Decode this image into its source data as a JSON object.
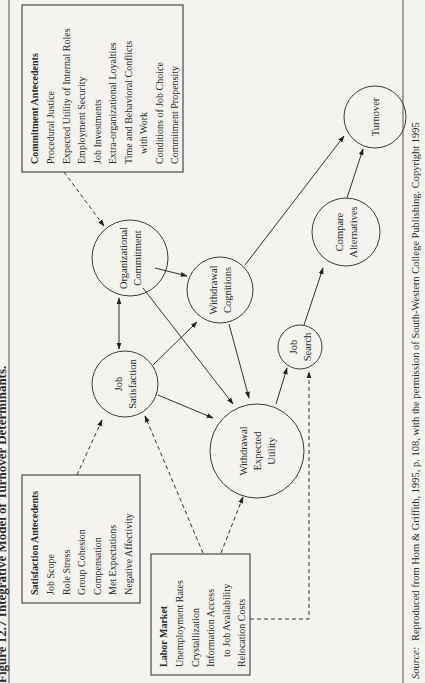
{
  "figure": {
    "title": "Figure 12.7 Integrative Model of Turnover Determinants.",
    "orientation": "rotated-90-ccw"
  },
  "nodes": {
    "organizational_commitment": {
      "lines": [
        "Organizational",
        "Commitment"
      ]
    },
    "job_satisfaction": {
      "lines": [
        "Job",
        "Satisfaction"
      ]
    },
    "withdrawal_cognitions": {
      "lines": [
        "Withdrawal",
        "Cognitions"
      ]
    },
    "withdrawal_expected_utility": {
      "lines": [
        "Withdrawal",
        "Expected",
        "Utility"
      ]
    },
    "job_search": {
      "lines": [
        "Job",
        "Search"
      ]
    },
    "compare_alternatives": {
      "lines": [
        "Compare",
        "Alternatives"
      ]
    },
    "turnover": {
      "lines": [
        "Turnover"
      ]
    }
  },
  "boxes": {
    "commitment_antecedents": {
      "heading": "Commitment Antecedents",
      "items": [
        "Procedural Justice",
        "Expected Utility of Internal Roles",
        "Employment Security",
        "Job Investments",
        "Extra-organizational Loyalties",
        "Time and Behavioral Conflicts",
        "with Work",
        "Conditions of Job Choice",
        "Commitment Propensity"
      ]
    },
    "satisfaction_antecedents": {
      "heading": "Satisfaction Antecedents",
      "items": [
        "Job Scope",
        "Role Stress",
        "Group Cohesion",
        "Compensation",
        "Met Expectations",
        "Negative Affectivity"
      ]
    },
    "labor_market": {
      "heading": "Labor Market",
      "items": [
        "Unemployment Rates",
        "Crystallization",
        "Information Access",
        "to Job Availability",
        "Relocation Costs"
      ]
    }
  },
  "caption": {
    "source_label": "Source:",
    "text": "Reproduced from Hom & Griffith, 1995, p. 108, with the permission of South-Western College Publishing. Copyright 1995"
  },
  "edges": [
    {
      "from": "commitment_antecedents",
      "to": "organizational_commitment",
      "style": "dashed"
    },
    {
      "from": "satisfaction_antecedents",
      "to": "job_satisfaction",
      "style": "dashed"
    },
    {
      "from": "labor_market",
      "to": "job_satisfaction",
      "style": "dashed"
    },
    {
      "from": "labor_market",
      "to": "withdrawal_expected_utility",
      "style": "dashed"
    },
    {
      "from": "labor_market",
      "to": "job_search",
      "style": "dashed"
    },
    {
      "from": "job_satisfaction",
      "to": "organizational_commitment",
      "style": "solid-bidirectional"
    },
    {
      "from": "job_satisfaction",
      "to": "withdrawal_cognitions",
      "style": "solid"
    },
    {
      "from": "job_satisfaction",
      "to": "withdrawal_expected_utility",
      "style": "solid"
    },
    {
      "from": "organizational_commitment",
      "to": "withdrawal_cognitions",
      "style": "solid"
    },
    {
      "from": "organizational_commitment",
      "to": "withdrawal_expected_utility",
      "style": "solid"
    },
    {
      "from": "withdrawal_cognitions",
      "to": "withdrawal_expected_utility",
      "style": "solid"
    },
    {
      "from": "withdrawal_cognitions",
      "to": "turnover",
      "style": "solid"
    },
    {
      "from": "withdrawal_expected_utility",
      "to": "job_search",
      "style": "solid"
    },
    {
      "from": "job_search",
      "to": "compare_alternatives",
      "style": "solid"
    },
    {
      "from": "compare_alternatives",
      "to": "turnover",
      "style": "solid"
    }
  ]
}
